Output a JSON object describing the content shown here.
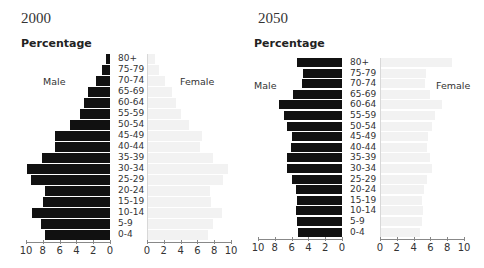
{
  "chart_data": [
    {
      "type": "bar",
      "subtype": "population-pyramid",
      "title": "2000",
      "ylabel": "Percentage",
      "left_label": "Male",
      "right_label": "Female",
      "categories": [
        "80+",
        "75-79",
        "70-74",
        "65-69",
        "60-64",
        "55-59",
        "50-54",
        "45-49",
        "40-44",
        "35-39",
        "30-34",
        "25-29",
        "20-24",
        "15-19",
        "10-14",
        "5-9",
        "0-4"
      ],
      "series": [
        {
          "name": "Male",
          "color": "#111111",
          "values": [
            0.5,
            0.9,
            1.7,
            2.6,
            3.1,
            3.6,
            4.8,
            6.5,
            6.5,
            8.1,
            9.9,
            9.4,
            7.7,
            8.0,
            9.3,
            8.2,
            7.7
          ]
        },
        {
          "name": "Female",
          "color": "#f2f2f2",
          "values": [
            0.9,
            1.4,
            2.2,
            3.0,
            3.5,
            4.0,
            5.0,
            6.6,
            6.3,
            7.8,
            9.6,
            9.1,
            7.5,
            7.6,
            8.9,
            7.8,
            7.3
          ]
        }
      ],
      "xticks_male": [
        "10",
        "8",
        "6",
        "4",
        "2",
        "0"
      ],
      "xticks_female": [
        "0",
        "2",
        "4",
        "6",
        "8",
        "10"
      ],
      "xlim": [
        0,
        10
      ],
      "grid": false
    },
    {
      "type": "bar",
      "subtype": "population-pyramid",
      "title": "2050",
      "ylabel": "Percentage",
      "left_label": "Male",
      "right_label": "Female",
      "categories": [
        "80+",
        "75-79",
        "70-74",
        "65-69",
        "60-64",
        "55-59",
        "50-54",
        "45-49",
        "40-44",
        "35-39",
        "30-34",
        "25-29",
        "20-24",
        "15-19",
        "10-14",
        "5-9",
        "0-4"
      ],
      "series": [
        {
          "name": "Male",
          "color": "#111111",
          "values": [
            5.4,
            4.7,
            4.8,
            5.8,
            7.5,
            6.9,
            6.6,
            6.0,
            6.1,
            6.5,
            6.5,
            6.0,
            5.5,
            5.4,
            5.5,
            5.4,
            5.2
          ]
        },
        {
          "name": "Female",
          "color": "#f2f2f2",
          "values": [
            8.6,
            5.5,
            5.4,
            5.9,
            7.4,
            6.6,
            6.2,
            5.7,
            5.6,
            6.0,
            6.2,
            5.6,
            5.2,
            5.0,
            5.1,
            5.0,
            4.8
          ]
        }
      ],
      "xticks_male": [
        "10",
        "8",
        "6",
        "4",
        "2",
        "0"
      ],
      "xticks_female": [
        "0",
        "2",
        "4",
        "6",
        "8",
        "10"
      ],
      "xlim": [
        0,
        10
      ],
      "grid": false
    }
  ],
  "panels": [
    {
      "year": "2000",
      "pct_label": "Percentage",
      "male_label": "Male",
      "female_label": "Female"
    },
    {
      "year": "2050",
      "pct_label": "Percentage",
      "male_label": "Male",
      "female_label": "Female"
    }
  ]
}
